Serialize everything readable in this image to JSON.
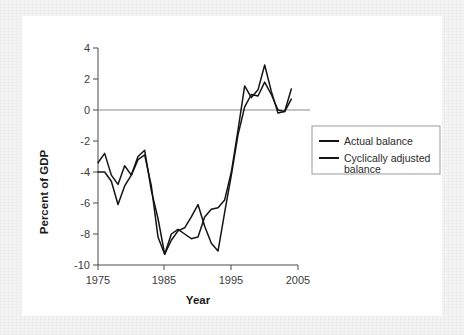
{
  "chart_data": {
    "type": "line",
    "title": "",
    "xlabel": "Year",
    "ylabel": "Percent of GDP",
    "xlim": [
      1975,
      2005
    ],
    "ylim": [
      -10,
      4
    ],
    "xticks": [
      1975,
      1985,
      1995,
      2005
    ],
    "xtick_labels": [
      "1975",
      "1985",
      "1995",
      "2005"
    ],
    "yticks": [
      4,
      2,
      0,
      -2,
      -4,
      -6,
      -8,
      -10
    ],
    "ytick_labels": [
      "4",
      "2",
      "0",
      "-2",
      "-4",
      "-6",
      "-8",
      "-10"
    ],
    "grid": false,
    "zero_line": true,
    "legend_position": "right-middle",
    "x": [
      1975,
      1976,
      1977,
      1978,
      1979,
      1980,
      1981,
      1982,
      1983,
      1984,
      1985,
      1986,
      1987,
      1988,
      1989,
      1990,
      1991,
      1992,
      1993,
      1994,
      1995,
      1996,
      1997,
      1998,
      1999,
      2000,
      2001,
      2002,
      2003,
      2004
    ],
    "series": [
      {
        "name": "Actual balance",
        "color": "#141414",
        "values": [
          -3.4,
          -2.8,
          -4.2,
          -4.8,
          -3.6,
          -4.2,
          -3.0,
          -2.6,
          -5.2,
          -7.0,
          -9.3,
          -8.4,
          -7.8,
          -7.6,
          -6.9,
          -6.1,
          -7.5,
          -8.6,
          -9.1,
          -6.6,
          -4.2,
          -1.6,
          0.2,
          1.0,
          0.9,
          1.8,
          1.0,
          0.0,
          -0.1,
          0.7
        ],
        "final_value": 0.7
      },
      {
        "name": "Cyclically adjusted balance",
        "color": "#141414",
        "values": [
          -4.0,
          -4.0,
          -4.6,
          -6.1,
          -4.9,
          -4.2,
          -3.2,
          -2.9,
          -4.9,
          -8.2,
          -9.3,
          -8.0,
          -7.7,
          -8.0,
          -8.3,
          -8.2,
          -6.9,
          -6.4,
          -6.3,
          -5.8,
          -4.0,
          -1.3,
          1.55,
          0.8,
          1.3,
          2.9,
          1.2,
          -0.2,
          -0.1,
          1.35
        ],
        "final_value": 1.35
      }
    ],
    "notes": {
      "actual_balance_label": "Actual balance",
      "cyclically_adjusted_label_line1": "Cyclically adjusted",
      "cyclically_adjusted_label_line2": "balance"
    }
  },
  "figure": {
    "x_axis_title": "Year",
    "y_axis_title": "Percent of GDP"
  },
  "legend": {
    "items": [
      {
        "label": "Actual balance",
        "label_line2": ""
      },
      {
        "label": "Cyclically adjusted",
        "label_line2": "balance"
      }
    ]
  }
}
